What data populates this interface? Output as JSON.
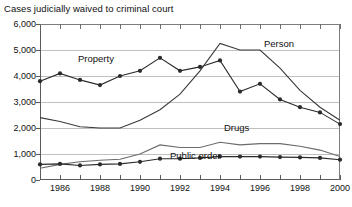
{
  "chart_data": {
    "type": "line",
    "title": "Cases judicially waived to criminal court",
    "xlabel": "",
    "ylabel": "",
    "ylim": [
      0,
      6000
    ],
    "xlim": [
      1985,
      2000
    ],
    "ytick_step": 1000,
    "grid": true,
    "legend_position": "inline-labels",
    "x": [
      1985,
      1986,
      1987,
      1988,
      1989,
      1990,
      1991,
      1992,
      1993,
      1994,
      1995,
      1996,
      1997,
      1998,
      1999,
      2000
    ],
    "ytick_labels": [
      "0",
      "1,000",
      "2,000",
      "3,000",
      "4,000",
      "5,000",
      "6,000"
    ],
    "ytick_values": [
      0,
      1000,
      2000,
      3000,
      4000,
      5000,
      6000
    ],
    "xtick_labels": [
      "1986",
      "1988",
      "1990",
      "1992",
      "1994",
      "1996",
      "1998",
      "2000"
    ],
    "xtick_label_values": [
      1986,
      1988,
      1990,
      1992,
      1994,
      1996,
      1998,
      2000
    ],
    "series": [
      {
        "name": "Property",
        "label": "Property",
        "markers": true,
        "color": "#2b2b2b",
        "values": [
          3800,
          4100,
          3850,
          3650,
          4000,
          4200,
          4700,
          4200,
          4350,
          4600,
          3400,
          3700,
          3100,
          2800,
          2600,
          2150
        ]
      },
      {
        "name": "Person",
        "label": "Person",
        "markers": false,
        "color": "#3a3a3a",
        "values": [
          2400,
          2250,
          2050,
          2000,
          2000,
          2300,
          2700,
          3300,
          4200,
          5250,
          5000,
          5000,
          4300,
          3450,
          2800,
          2300
        ]
      },
      {
        "name": "Drugs",
        "label": "Drugs",
        "markers": false,
        "color": "#6b6b6b",
        "values": [
          450,
          600,
          700,
          760,
          800,
          1000,
          1350,
          1250,
          1250,
          1450,
          1350,
          1400,
          1400,
          1300,
          1150,
          900
        ]
      },
      {
        "name": "Public order",
        "label": "Public order",
        "markers": true,
        "color": "#2b2b2b",
        "values": [
          600,
          620,
          560,
          600,
          620,
          700,
          820,
          820,
          850,
          900,
          900,
          900,
          880,
          870,
          850,
          780
        ]
      }
    ],
    "annotations": [
      {
        "text": "Property",
        "series": "Property"
      },
      {
        "text": "Person",
        "series": "Person"
      },
      {
        "text": "Drugs",
        "series": "Drugs"
      },
      {
        "text": "Public order",
        "series": "Public order"
      }
    ]
  }
}
